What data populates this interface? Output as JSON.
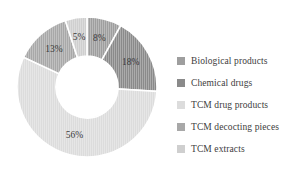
{
  "chart_data": {
    "type": "pie",
    "variant": "donut",
    "title": "",
    "subtitle": "",
    "xlabel": "",
    "ylabel": "",
    "grid": false,
    "legend_position": "right",
    "value_suffix": "%",
    "start_angle_deg": 0,
    "direction": "clockwise",
    "categories": [
      "Biological products",
      "Chemical drugs",
      "TCM drug products",
      "TCM decocting pieces",
      "TCM extracts"
    ],
    "values": [
      8,
      18,
      56,
      13,
      5
    ],
    "labels": [
      "8%",
      "18%",
      "56%",
      "13%",
      "5%"
    ],
    "colors": [
      "#9e9e9e",
      "#8a8a8a",
      "#dcdcdc",
      "#a8a8a8",
      "#cfcfcf"
    ],
    "slices": [
      {
        "label": "Biological products",
        "value": 8,
        "display": "8%",
        "color": "#9e9e9e"
      },
      {
        "label": "Chemical drugs",
        "value": 18,
        "display": "18%",
        "color": "#8a8a8a"
      },
      {
        "label": "TCM drug products",
        "value": 56,
        "display": "56%",
        "color": "#dcdcdc"
      },
      {
        "label": "TCM decocting pieces",
        "value": 13,
        "display": "13%",
        "color": "#a8a8a8"
      },
      {
        "label": "TCM extracts",
        "value": 5,
        "display": "5%",
        "color": "#cfcfcf"
      }
    ]
  },
  "legend": {
    "items": [
      {
        "label": "Biological products",
        "color": "#9e9e9e"
      },
      {
        "label": "Chemical drugs",
        "color": "#8a8a8a"
      },
      {
        "label": "TCM drug products",
        "color": "#dcdcdc"
      },
      {
        "label": "TCM decocting pieces",
        "color": "#a8a8a8"
      },
      {
        "label": "TCM extracts",
        "color": "#cfcfcf"
      }
    ]
  },
  "geometry": {
    "center_x": 71,
    "center_y": 71,
    "outer_radius": 70,
    "inner_radius": 31,
    "label_radius": 50,
    "separator_color": "#ffffff",
    "separator_width": 1.6,
    "background": "#ffffff"
  }
}
